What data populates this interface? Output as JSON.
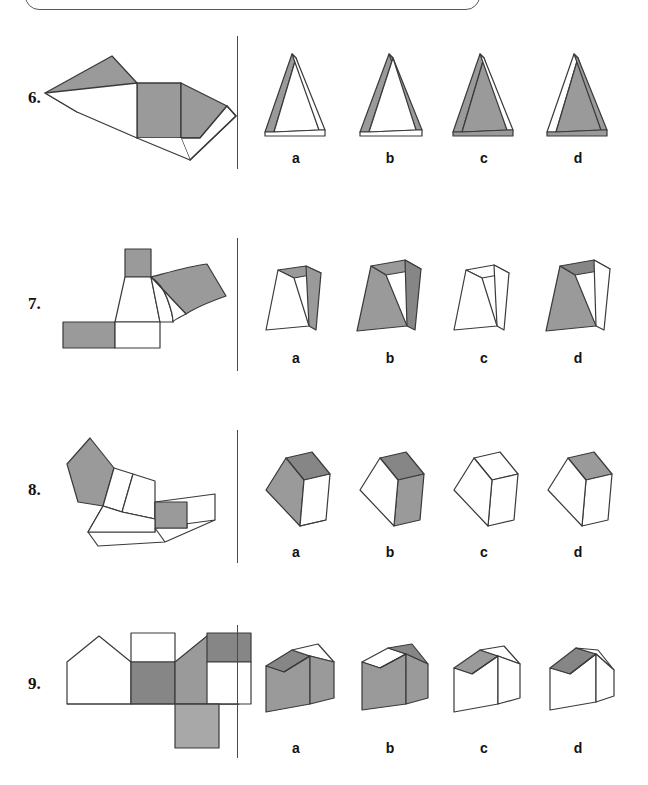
{
  "page": {
    "width": 648,
    "height": 785,
    "background": "#ffffff"
  },
  "style": {
    "gray_fill": "#9a9a9a",
    "gray_dark": "#868686",
    "gray_light": "#a8a8a8",
    "white_fill": "#ffffff",
    "stroke": "#3a3a3c",
    "divider_color": "#4a4a4c",
    "text_color": "#111111"
  },
  "top_box": {
    "present": true,
    "border_color": "#58585a"
  },
  "option_letters": [
    "a",
    "b",
    "c",
    "d"
  ],
  "questions": [
    {
      "number": "6.",
      "net_description": "triangular-prism-net",
      "options": [
        {
          "letter": "a",
          "shape": "triangular-prism",
          "front": "white",
          "left_side": "gray",
          "right_side": "white"
        },
        {
          "letter": "b",
          "shape": "triangular-prism",
          "front": "white",
          "left_side": "gray",
          "right_side": "gray"
        },
        {
          "letter": "c",
          "shape": "triangular-prism",
          "front": "gray",
          "left_side": "gray",
          "right_side": "white"
        },
        {
          "letter": "d",
          "shape": "triangular-prism",
          "front": "gray",
          "left_side": "white",
          "right_side": "gray"
        }
      ]
    },
    {
      "number": "7.",
      "net_description": "frustum-truncated-pyramid-net",
      "options": [
        {
          "letter": "a",
          "shape": "frustum",
          "front": "white",
          "top": "gray",
          "right_side": "gray"
        },
        {
          "letter": "b",
          "shape": "frustum",
          "front": "gray",
          "top": "gray",
          "right_side": "gray"
        },
        {
          "letter": "c",
          "shape": "frustum",
          "front": "white",
          "top": "white",
          "right_side": "white"
        },
        {
          "letter": "d",
          "shape": "frustum",
          "front": "gray",
          "top": "gray",
          "right_side": "white"
        }
      ]
    },
    {
      "number": "8.",
      "net_description": "pentagonal-prism-net",
      "options": [
        {
          "letter": "a",
          "shape": "pentagonal-prism",
          "front": "gray",
          "top": "gray",
          "right_side": "white"
        },
        {
          "letter": "b",
          "shape": "pentagonal-prism",
          "front": "white",
          "top": "gray",
          "right_side": "gray"
        },
        {
          "letter": "c",
          "shape": "pentagonal-prism",
          "front": "white",
          "top": "white",
          "right_side": "white"
        },
        {
          "letter": "d",
          "shape": "pentagonal-prism",
          "front": "white",
          "top": "gray",
          "right_side": "white"
        }
      ]
    },
    {
      "number": "9.",
      "net_description": "house-prism-net",
      "options": [
        {
          "letter": "a",
          "shape": "house-prism",
          "front": "gray",
          "roof_left": "gray",
          "roof_right": "white",
          "right_side": "gray"
        },
        {
          "letter": "b",
          "shape": "house-prism",
          "front": "gray",
          "roof_left": "white",
          "roof_right": "gray",
          "right_side": "gray"
        },
        {
          "letter": "c",
          "shape": "house-prism",
          "front": "white",
          "roof_left": "gray",
          "roof_right": "white",
          "right_side": "white"
        },
        {
          "letter": "d",
          "shape": "house-prism",
          "front": "white",
          "roof_left": "gray",
          "roof_right": "white",
          "right_side": "white"
        }
      ]
    }
  ],
  "layout": {
    "divider_x": 237,
    "option_x_centers": [
      296,
      390,
      484,
      578
    ],
    "rows": [
      {
        "number_y": 97,
        "divider_top": 36,
        "divider_height": 133,
        "letters_y": 148
      },
      {
        "number_y": 303,
        "divider_top": 238,
        "divider_height": 133,
        "letters_y": 348
      },
      {
        "number_y": 489,
        "divider_top": 430,
        "divider_height": 133,
        "letters_y": 542
      },
      {
        "number_y": 683,
        "divider_top": 625,
        "divider_height": 133,
        "letters_y": 738
      }
    ]
  }
}
